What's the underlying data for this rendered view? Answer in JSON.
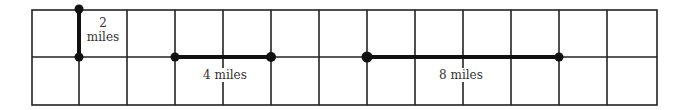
{
  "diagram": {
    "type": "grid-scale",
    "grid": {
      "columns": 13,
      "rows": 2
    },
    "segments": [
      {
        "label_line1": "2",
        "label_line2": "miles",
        "orientation": "vertical",
        "units": 1
      },
      {
        "label": "4 miles",
        "orientation": "horizontal",
        "units": 2
      },
      {
        "label": "8 miles",
        "orientation": "horizontal",
        "units": 4
      }
    ],
    "colors": {
      "line": "#222222",
      "background": "#ffffff"
    }
  }
}
